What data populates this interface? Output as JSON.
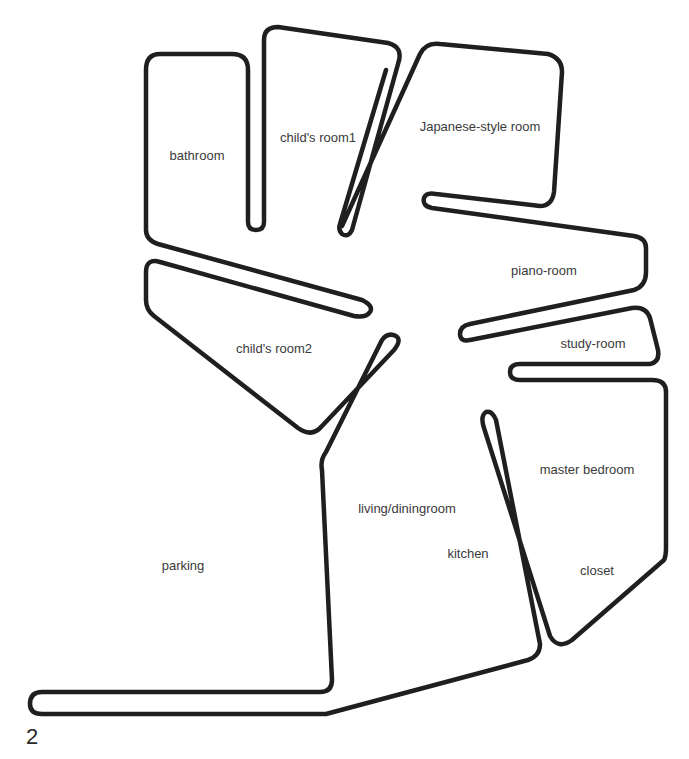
{
  "figure": {
    "number": "2",
    "stroke_color": "#1f1f1f",
    "label_color": "#3a3a3a",
    "background": "#ffffff"
  },
  "rooms": {
    "bathroom": {
      "label": "bathroom",
      "x": 197,
      "y": 155
    },
    "childs_room1": {
      "label": "child's room1",
      "x": 318,
      "y": 137
    },
    "japanese_room": {
      "label": "Japanese-style room",
      "x": 480,
      "y": 126
    },
    "piano_room": {
      "label": "piano-room",
      "x": 544,
      "y": 270
    },
    "study_room": {
      "label": "study-room",
      "x": 593,
      "y": 343
    },
    "childs_room2": {
      "label": "child's room2",
      "x": 274,
      "y": 348
    },
    "master_bedroom": {
      "label": "master bedroom",
      "x": 587,
      "y": 469
    },
    "living_dining": {
      "label": "living/diningroom",
      "x": 407,
      "y": 508
    },
    "kitchen": {
      "label": "kitchen",
      "x": 468,
      "y": 553
    },
    "closet": {
      "label": "closet",
      "x": 597,
      "y": 570
    },
    "parking": {
      "label": "parking",
      "x": 183,
      "y": 565
    }
  }
}
